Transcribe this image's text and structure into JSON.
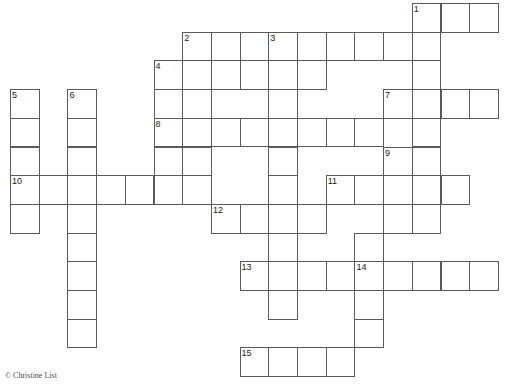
{
  "puzzle": {
    "type": "crossword-grid",
    "title": "Crossword Puzzle Grid",
    "origin_x": 10,
    "origin_y": 3,
    "cell_size": 28.7,
    "grid_columns": 18,
    "grid_rows": 13,
    "cell_fill": "#ffffff",
    "cell_border": "#5a5a5a",
    "number_color": "#1a1a1a",
    "entries": [
      {
        "number": 1,
        "direction": "across",
        "row": 0,
        "col": 14,
        "length": 3
      },
      {
        "number": 1,
        "direction": "down",
        "row": 0,
        "col": 14,
        "length": 7
      },
      {
        "number": 2,
        "direction": "across",
        "row": 1,
        "col": 6,
        "length": 8
      },
      {
        "number": 2,
        "direction": "down",
        "row": 1,
        "col": 6,
        "length": 4
      },
      {
        "number": 3,
        "direction": "down",
        "row": 1,
        "col": 9,
        "length": 3
      },
      {
        "number": 4,
        "direction": "across",
        "row": 2,
        "col": 5,
        "length": 6
      },
      {
        "number": 4,
        "direction": "down",
        "row": 2,
        "col": 5,
        "length": 5
      },
      {
        "number": 5,
        "direction": "down",
        "row": 3,
        "col": 0,
        "length": 5
      },
      {
        "number": 6,
        "direction": "down",
        "row": 3,
        "col": 2,
        "length": 9
      },
      {
        "number": 7,
        "direction": "across",
        "row": 3,
        "col": 13,
        "length": 4
      },
      {
        "number": 8,
        "direction": "across",
        "row": 4,
        "col": 5,
        "length": 8
      },
      {
        "number": 9,
        "direction": "down",
        "row": 5,
        "col": 13,
        "length": 3
      },
      {
        "number": 10,
        "direction": "across",
        "row": 6,
        "col": 0,
        "length": 7
      },
      {
        "number": 11,
        "direction": "across",
        "row": 6,
        "col": 11,
        "length": 5
      },
      {
        "number": 12,
        "direction": "across",
        "row": 7,
        "col": 7,
        "length": 4
      },
      {
        "number": 13,
        "direction": "across",
        "row": 9,
        "col": 8,
        "length": 9
      },
      {
        "number": 13,
        "direction": "down",
        "row": 9,
        "col": 8,
        "length": 3
      },
      {
        "number": 14,
        "direction": "down",
        "row": 9,
        "col": 12,
        "length": 4
      },
      {
        "number": 15,
        "direction": "across",
        "row": 12,
        "col": 8,
        "length": 4
      }
    ],
    "cells": [
      {
        "row": 0,
        "col": 14,
        "number": 1
      },
      {
        "row": 0,
        "col": 15
      },
      {
        "row": 0,
        "col": 16
      },
      {
        "row": 1,
        "col": 6,
        "number": 2
      },
      {
        "row": 1,
        "col": 7
      },
      {
        "row": 1,
        "col": 8
      },
      {
        "row": 1,
        "col": 9,
        "number": 3
      },
      {
        "row": 1,
        "col": 10
      },
      {
        "row": 1,
        "col": 11
      },
      {
        "row": 1,
        "col": 12
      },
      {
        "row": 1,
        "col": 13
      },
      {
        "row": 1,
        "col": 14
      },
      {
        "row": 2,
        "col": 5,
        "number": 4
      },
      {
        "row": 2,
        "col": 6
      },
      {
        "row": 2,
        "col": 7
      },
      {
        "row": 2,
        "col": 8
      },
      {
        "row": 2,
        "col": 9
      },
      {
        "row": 2,
        "col": 10
      },
      {
        "row": 2,
        "col": 14
      },
      {
        "row": 3,
        "col": 0,
        "number": 5
      },
      {
        "row": 3,
        "col": 2,
        "number": 6
      },
      {
        "row": 3,
        "col": 5
      },
      {
        "row": 3,
        "col": 6
      },
      {
        "row": 3,
        "col": 9
      },
      {
        "row": 3,
        "col": 13,
        "number": 7
      },
      {
        "row": 3,
        "col": 14
      },
      {
        "row": 3,
        "col": 15
      },
      {
        "row": 3,
        "col": 16
      },
      {
        "row": 4,
        "col": 0
      },
      {
        "row": 4,
        "col": 2
      },
      {
        "row": 4,
        "col": 5,
        "number": 8
      },
      {
        "row": 4,
        "col": 6
      },
      {
        "row": 4,
        "col": 7
      },
      {
        "row": 4,
        "col": 8
      },
      {
        "row": 4,
        "col": 9
      },
      {
        "row": 4,
        "col": 10
      },
      {
        "row": 4,
        "col": 11
      },
      {
        "row": 4,
        "col": 12
      },
      {
        "row": 4,
        "col": 14
      },
      {
        "row": 5,
        "col": 0
      },
      {
        "row": 5,
        "col": 2
      },
      {
        "row": 5,
        "col": 5
      },
      {
        "row": 5,
        "col": 6
      },
      {
        "row": 5,
        "col": 9
      },
      {
        "row": 5,
        "col": 13,
        "number": 9
      },
      {
        "row": 5,
        "col": 14
      },
      {
        "row": 6,
        "col": 0,
        "number": 10
      },
      {
        "row": 6,
        "col": 1
      },
      {
        "row": 6,
        "col": 2
      },
      {
        "row": 6,
        "col": 3
      },
      {
        "row": 6,
        "col": 4
      },
      {
        "row": 6,
        "col": 5
      },
      {
        "row": 6,
        "col": 6
      },
      {
        "row": 6,
        "col": 9
      },
      {
        "row": 6,
        "col": 11,
        "number": 11
      },
      {
        "row": 6,
        "col": 12
      },
      {
        "row": 6,
        "col": 13
      },
      {
        "row": 6,
        "col": 14
      },
      {
        "row": 6,
        "col": 15
      },
      {
        "row": 7,
        "col": 0
      },
      {
        "row": 7,
        "col": 2
      },
      {
        "row": 7,
        "col": 7,
        "number": 12
      },
      {
        "row": 7,
        "col": 8
      },
      {
        "row": 7,
        "col": 9
      },
      {
        "row": 7,
        "col": 10
      },
      {
        "row": 7,
        "col": 13
      },
      {
        "row": 7,
        "col": 14
      },
      {
        "row": 8,
        "col": 2
      },
      {
        "row": 8,
        "col": 9
      },
      {
        "row": 8,
        "col": 12
      },
      {
        "row": 9,
        "col": 2
      },
      {
        "row": 9,
        "col": 8,
        "number": 13
      },
      {
        "row": 9,
        "col": 9
      },
      {
        "row": 9,
        "col": 10
      },
      {
        "row": 9,
        "col": 11
      },
      {
        "row": 9,
        "col": 12,
        "number": 14
      },
      {
        "row": 9,
        "col": 13
      },
      {
        "row": 9,
        "col": 14
      },
      {
        "row": 9,
        "col": 15
      },
      {
        "row": 9,
        "col": 16
      },
      {
        "row": 10,
        "col": 2
      },
      {
        "row": 10,
        "col": 9
      },
      {
        "row": 10,
        "col": 12
      },
      {
        "row": 11,
        "col": 2
      },
      {
        "row": 11,
        "col": 12
      },
      {
        "row": 12,
        "col": 8,
        "number": 15
      },
      {
        "row": 12,
        "col": 9
      },
      {
        "row": 12,
        "col": 10
      },
      {
        "row": 12,
        "col": 11
      }
    ]
  },
  "footer": {
    "copyright": "© Christine List",
    "x": 5,
    "y": 371
  }
}
